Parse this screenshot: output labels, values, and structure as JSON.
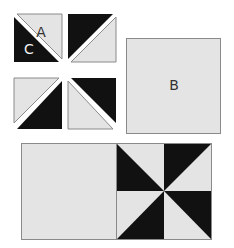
{
  "diagram": {
    "colors": {
      "light": "#e4e4e4",
      "dark": "#111111",
      "outline": "#8a8a8a",
      "gap": "#ffffff",
      "label": "#f2f2f2",
      "label_dark_bg": "#333333"
    },
    "units": {
      "half_square_triangles": {
        "label_light": "A",
        "label_dark": "C",
        "count": 4
      },
      "plain_square": {
        "label": "B"
      },
      "assembled_row": {
        "left": "plain square",
        "right": "pinwheel block"
      }
    }
  }
}
